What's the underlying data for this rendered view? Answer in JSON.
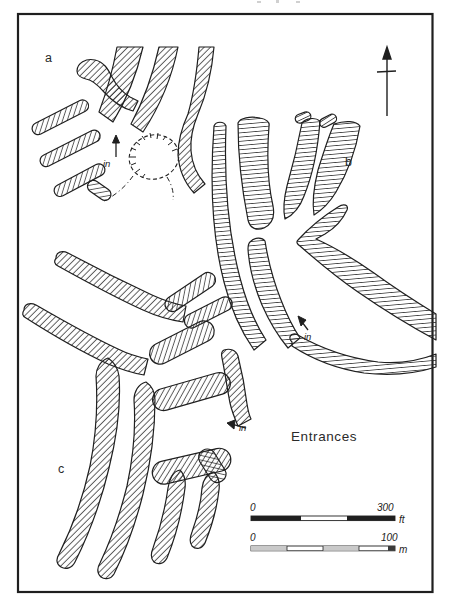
{
  "figure": {
    "caption": "Entrances",
    "panels": [
      {
        "label": "a"
      },
      {
        "label": "b"
      },
      {
        "label": "c"
      }
    ],
    "entrance_label": "in",
    "north_arrow_icon": "north-arrow",
    "scale_ft": {
      "start": "0",
      "end": "300",
      "unit": "ft"
    },
    "scale_m": {
      "start": "0",
      "end": "100",
      "unit": "m"
    },
    "colors": {
      "ink": "#1f1f1f",
      "paper": "#ffffff",
      "hatch": "#2b2b2b"
    }
  }
}
